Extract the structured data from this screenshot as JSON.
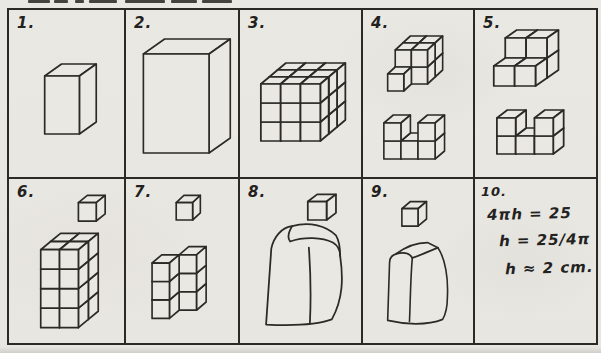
{
  "colors": {
    "paper": "#eae8e2",
    "ink": "#2b2a27",
    "label_ink": "#22211e"
  },
  "cells": [
    {
      "label": "1."
    },
    {
      "label": "2."
    },
    {
      "label": "3."
    },
    {
      "label": "4."
    },
    {
      "label": "5."
    },
    {
      "label": "6."
    },
    {
      "label": "7."
    },
    {
      "label": "8."
    },
    {
      "label": "9."
    },
    {
      "label": "10.",
      "math": [
        "4πh = 25",
        "h = 25/4π",
        "h ≈ 2 cm."
      ]
    }
  ],
  "figures": {
    "f1": {
      "figs": [
        {
          "type": "box",
          "ox": 36,
          "oy": 124,
          "w": 35,
          "h": 58,
          "d": 17,
          "e": 12
        }
      ]
    },
    "f2": {
      "figs": [
        {
          "type": "box",
          "ox": 18,
          "oy": 143,
          "w": 68,
          "h": 99,
          "d": 22,
          "e": 15
        }
      ]
    },
    "f3": {
      "figs": [
        {
          "type": "cubes",
          "s": 19,
          "d": 8,
          "e": 7,
          "ox": 20,
          "oy": 131,
          "grid": [
            3,
            3,
            3
          ]
        }
      ]
    },
    "f4": {
      "figs": [
        {
          "type": "cubes",
          "s": 17,
          "d": 8,
          "e": 7,
          "ox": 34,
          "oy": 74,
          "cubes": [
            [
              0,
              0,
              1
            ],
            [
              1,
              0,
              1
            ],
            [
              0,
              1,
              1
            ],
            [
              1,
              1,
              1
            ],
            [
              0,
              0,
              0
            ],
            [
              1,
              0,
              0
            ],
            [
              0,
              1,
              0
            ],
            [
              1,
              1,
              0
            ],
            [
              0,
              0,
              -1
            ]
          ]
        },
        {
          "type": "cubes",
          "s": 18,
          "d": 10,
          "e": 8,
          "ox": 22,
          "oy": 149,
          "cubes": [
            [
              0,
              0,
              0
            ],
            [
              1,
              0,
              0
            ],
            [
              2,
              0,
              0
            ],
            [
              0,
              1,
              0
            ],
            [
              2,
              1,
              0
            ]
          ]
        }
      ]
    },
    "f5": {
      "figs": [
        {
          "type": "cubes",
          "s": 20,
          "d": 11,
          "e": 8,
          "ox": 18,
          "oy": 76,
          "cubes": [
            [
              0,
              0,
              1
            ],
            [
              1,
              0,
              1
            ],
            [
              0,
              1,
              1
            ],
            [
              1,
              1,
              1
            ],
            [
              0,
              0,
              0
            ],
            [
              1,
              0,
              0
            ]
          ]
        },
        {
          "type": "cubes",
          "s": 18,
          "d": 10,
          "e": 8,
          "ox": 21,
          "oy": 144,
          "cubes": [
            [
              0,
              0,
              0
            ],
            [
              1,
              0,
              0
            ],
            [
              2,
              0,
              0
            ],
            [
              0,
              1,
              0
            ],
            [
              2,
              1,
              0
            ]
          ]
        }
      ]
    },
    "f6": {
      "figs": [
        {
          "type": "box",
          "ox": 70,
          "oy": 41,
          "w": 18,
          "h": 18,
          "d": 9,
          "e": 7
        },
        {
          "type": "cubes",
          "s": 19,
          "d": 10,
          "e": 8,
          "ox": 32,
          "oy": 145,
          "grid": [
            2,
            4,
            2
          ]
        }
      ]
    },
    "f7": {
      "figs": [
        {
          "type": "box",
          "ox": 52,
          "oy": 40,
          "w": 17,
          "h": 17,
          "d": 8,
          "e": 7
        },
        {
          "type": "cubes",
          "s": 18,
          "d": 10,
          "e": 8,
          "ox": 27,
          "oy": 136,
          "cubes": [
            [
              1,
              0,
              1
            ],
            [
              1,
              1,
              1
            ],
            [
              1,
              2,
              1
            ],
            [
              0,
              0,
              0
            ],
            [
              0,
              1,
              0
            ],
            [
              0,
              2,
              0
            ]
          ]
        }
      ]
    },
    "f8": {
      "figs": [
        {
          "type": "box",
          "ox": 65,
          "oy": 40,
          "w": 18,
          "h": 18,
          "d": 9,
          "e": 7
        },
        {
          "type": "path",
          "paths": [
            {
              "d": "M 25 142 L 30 68 C 32 57 40 47 50 46 C 47 51 45 57 48 61 C 62 56 79 57 89 62 C 94 65 96 70 96 75 C 99 96 99 117 88 137 C 72 143 45 143 25 142 Z",
              "fill": true
            },
            {
              "d": "M 50 46 C 67 41 83 46 92 55 C 95 60 96 68 96 75",
              "fill": false
            },
            {
              "d": "M 66 67 C 68 95 68 120 67 141",
              "fill": false
            }
          ]
        }
      ]
    },
    "f9": {
      "figs": [
        {
          "type": "box",
          "ox": 41,
          "oy": 46,
          "w": 17,
          "h": 17,
          "d": 9,
          "e": 7
        },
        {
          "type": "path",
          "paths": [
            {
              "d": "M 26 138 L 28 82 C 28 77 31 74 35 73 C 45 66 57 62 68 62 L 79 67 C 87 78 90 97 89 115 C 89 125 87 132 84 137 C 68 143 44 142 26 138 Z",
              "fill": true
            },
            {
              "d": "M 35 73 C 43 71 49 72 52 77",
              "fill": false
            },
            {
              "d": "M 52 77 C 62 74 71 70 79 67",
              "fill": false
            },
            {
              "d": "M 52 77 C 50 98 50 119 49 139",
              "fill": false
            }
          ]
        }
      ]
    }
  }
}
